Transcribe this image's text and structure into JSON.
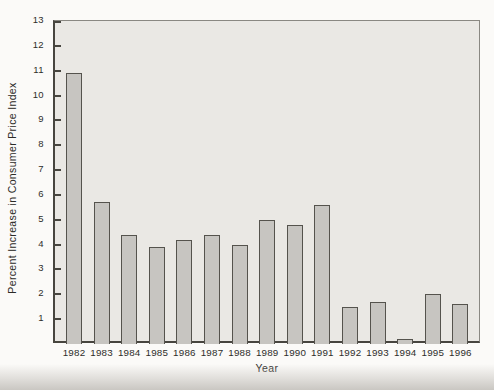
{
  "chart_data": {
    "type": "bar",
    "title": "",
    "xlabel": "Year",
    "ylabel": "Percent Increase in Consumer Price Index",
    "categories": [
      "1982",
      "1983",
      "1984",
      "1985",
      "1986",
      "1987",
      "1988",
      "1989",
      "1990",
      "1991",
      "1992",
      "1993",
      "1994",
      "1995",
      "1996"
    ],
    "values": [
      10.9,
      5.7,
      4.4,
      3.9,
      4.2,
      4.4,
      4.0,
      5.0,
      4.8,
      5.6,
      1.5,
      1.7,
      0.2,
      2.0,
      1.6
    ],
    "ylim": [
      0,
      13
    ],
    "yticks": [
      1,
      2,
      3,
      4,
      5,
      6,
      7,
      8,
      9,
      10,
      11,
      12,
      13
    ],
    "grid": false,
    "legend": null,
    "colors": {
      "plot_background": "#eae8e4",
      "bar_fill": "#c7c5c1",
      "bar_border": "#55534d",
      "axis_line": "#47453f",
      "text": "#2e2d2a"
    }
  }
}
